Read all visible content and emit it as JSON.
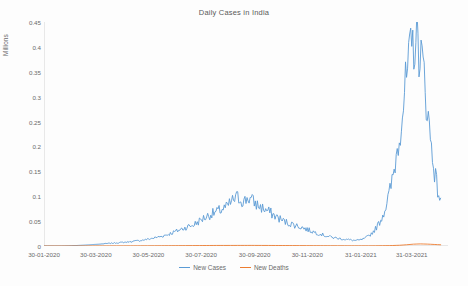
{
  "chart_data": {
    "type": "line",
    "title": "Daily Cases in India",
    "xlabel": "",
    "ylabel": "Millions",
    "ylim": [
      0,
      0.45
    ],
    "ytick_labels": [
      "0",
      "0.05",
      "0.1",
      "0.15",
      "0.2",
      "0.25",
      "0.3",
      "0.35",
      "0.4",
      "0.45"
    ],
    "ytick_values": [
      0,
      0.05,
      0.1,
      0.15,
      0.2,
      0.25,
      0.3,
      0.35,
      0.4,
      0.45
    ],
    "xtick_labels": [
      "30-01-2020",
      "30-03-2020",
      "30-05-2020",
      "30-07-2020",
      "30-09-2020",
      "30-11-2020",
      "31-01-2021",
      "31-03-2021"
    ],
    "xtick_positions": [
      0,
      60,
      121,
      182,
      244,
      305,
      367,
      426
    ],
    "grid": false,
    "legend_position": "bottom",
    "axis_color": "#bfbfbf",
    "series": [
      {
        "name": "New Cases",
        "color": "#5b9bd5",
        "x": [
          0,
          8,
          16,
          24,
          32,
          40,
          48,
          56,
          64,
          72,
          80,
          88,
          96,
          104,
          112,
          120,
          128,
          136,
          144,
          152,
          160,
          164,
          168,
          172,
          176,
          180,
          184,
          188,
          192,
          196,
          200,
          204,
          208,
          212,
          216,
          220,
          224,
          228,
          232,
          236,
          240,
          244,
          248,
          252,
          256,
          260,
          264,
          268,
          272,
          276,
          280,
          284,
          288,
          292,
          296,
          300,
          304,
          308,
          312,
          316,
          320,
          324,
          328,
          332,
          336,
          340,
          344,
          348,
          352,
          356,
          360,
          364,
          368,
          372,
          376,
          380,
          384,
          388,
          392,
          396,
          400,
          404,
          408,
          412,
          416,
          420,
          424,
          428,
          432,
          436,
          440,
          444,
          448,
          452,
          456,
          460
        ],
        "values": [
          0,
          0,
          0,
          0.0001,
          0.0005,
          0.0012,
          0.0019,
          0.0029,
          0.0037,
          0.0048,
          0.0058,
          0.0068,
          0.0079,
          0.0095,
          0.0112,
          0.0135,
          0.0163,
          0.0195,
          0.0235,
          0.0288,
          0.0345,
          0.0372,
          0.0396,
          0.0415,
          0.0455,
          0.0502,
          0.0549,
          0.0588,
          0.0627,
          0.0656,
          0.0683,
          0.0717,
          0.0752,
          0.0779,
          0.0865,
          0.0932,
          0.0978,
          0.0935,
          0.0889,
          0.0975,
          0.0932,
          0.0867,
          0.0812,
          0.0772,
          0.0733,
          0.0694,
          0.0648,
          0.0597,
          0.0561,
          0.0513,
          0.0482,
          0.0455,
          0.0436,
          0.0411,
          0.0392,
          0.0367,
          0.0338,
          0.0312,
          0.0287,
          0.0263,
          0.0243,
          0.0219,
          0.0197,
          0.0182,
          0.0168,
          0.0154,
          0.0145,
          0.0137,
          0.0128,
          0.0119,
          0.0112,
          0.0113,
          0.0128,
          0.0156,
          0.0198,
          0.0262,
          0.0345,
          0.0455,
          0.0598,
          0.0798,
          0.1045,
          0.1368,
          0.1795,
          0.2285,
          0.2845,
          0.3355,
          0.3785,
          0.4085,
          0.4145,
          0.3925,
          0.3445,
          0.2765,
          0.2105,
          0.1565,
          0.1125,
          0.0865
        ]
      },
      {
        "name": "New Deaths",
        "color": "#ed7d31",
        "x": [
          0,
          40,
          80,
          120,
          160,
          200,
          240,
          280,
          320,
          360,
          380,
          400,
          412,
          420,
          428,
          436,
          444,
          452,
          460
        ],
        "values": [
          0,
          2e-05,
          0.00015,
          0.00035,
          0.0007,
          0.0011,
          0.0012,
          0.00095,
          0.00055,
          0.0003,
          0.00035,
          0.00075,
          0.0015,
          0.0025,
          0.0037,
          0.0042,
          0.0038,
          0.0031,
          0.0024
        ]
      }
    ]
  }
}
